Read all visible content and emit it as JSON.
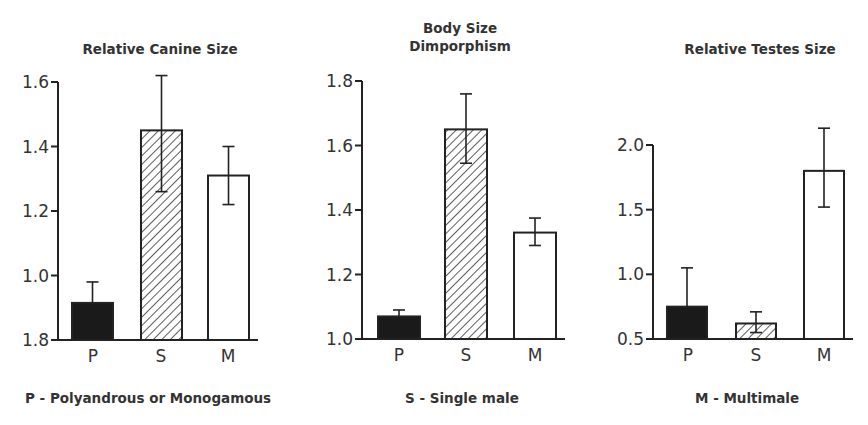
{
  "chart_data": [
    {
      "type": "bar",
      "title": "Relative Canine Size",
      "categories": [
        "P",
        "S",
        "M"
      ],
      "values": [
        0.915,
        1.45,
        1.31
      ],
      "error_low": [
        0.915,
        1.26,
        1.22
      ],
      "error_high": [
        0.98,
        1.62,
        1.4
      ],
      "yticks": [
        0.8,
        1.0,
        1.2,
        1.4,
        1.6
      ],
      "ytick_labels": [
        "1.8",
        "1.0",
        "1.2",
        "1.4",
        "1.6"
      ],
      "ylim": [
        0.8,
        1.6
      ],
      "xlabel": "",
      "ylabel": "",
      "grid": false
    },
    {
      "type": "bar",
      "title": "Body Size Dimporphism",
      "categories": [
        "P",
        "S",
        "M"
      ],
      "values": [
        1.07,
        1.65,
        1.33
      ],
      "error_low": [
        1.07,
        1.545,
        1.29
      ],
      "error_high": [
        1.09,
        1.76,
        1.375
      ],
      "yticks": [
        1.0,
        1.2,
        1.4,
        1.6,
        1.8
      ],
      "ytick_labels": [
        "1.0",
        "1.2",
        "1.4",
        "1.6",
        "1.8"
      ],
      "ylim": [
        1.0,
        1.8
      ],
      "xlabel": "",
      "ylabel": "",
      "grid": false
    },
    {
      "type": "bar",
      "title": "Relative Testes Size",
      "categories": [
        "P",
        "S",
        "M"
      ],
      "values": [
        0.75,
        0.62,
        1.8
      ],
      "error_low": [
        0.75,
        0.55,
        1.52
      ],
      "error_high": [
        1.05,
        0.71,
        2.13
      ],
      "yticks": [
        0.5,
        1.0,
        1.5,
        2.0
      ],
      "ytick_labels": [
        "0.5",
        "1.0",
        "1.5",
        "2.0"
      ],
      "ylim": [
        0.5,
        2.0
      ],
      "xlabel": "",
      "ylabel": "",
      "grid": false
    }
  ],
  "titles": {
    "chart1": "Relative Canine Size",
    "chart2_line1": "Body Size",
    "chart2_line2": "Dimporphism",
    "chart3": "Relative Testes Size"
  },
  "legend": {
    "p": "P - Polyandrous or Monogamous",
    "s": "S - Single male",
    "m": "M - Multimale"
  },
  "fills": {
    "P": "solid-black",
    "S": "diagonal-hatch",
    "M": "white"
  },
  "colors": {
    "ink": "#222222",
    "bar_solid": "#1a1a1a",
    "background": "#ffffff"
  }
}
